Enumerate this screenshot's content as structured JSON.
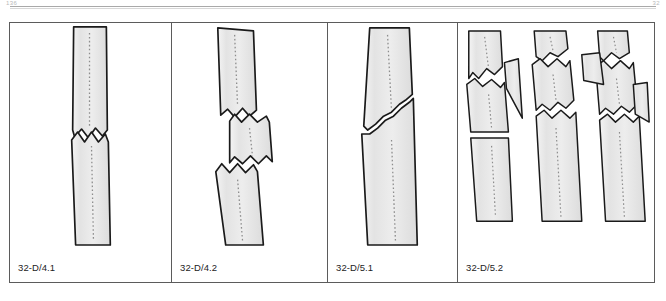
{
  "header": {
    "left_text": "136",
    "right_text": "32",
    "rule_color": "#a9a9a9"
  },
  "figure": {
    "name": "fracture-classification-figure",
    "border_color": "#5b5b5b",
    "background": "#ffffff",
    "bone_fill": "#e8e8e8",
    "bone_outline": "#1a1a1a",
    "marrow_color": "#8d8d8d",
    "panels": [
      {
        "id": "panel-1",
        "label": "32-D/4.1",
        "icon": "bone-transverse-fracture-icon",
        "description": "Simple transverse fracture of diaphysis, single zigzag fracture line, no displacement",
        "fragment_count": 2,
        "fracture_type": "transverse"
      },
      {
        "id": "panel-2",
        "label": "32-D/4.2",
        "icon": "bone-segmental-fracture-icon",
        "description": "Segmental fracture with displaced intermediate shaft segment between two transverse lines",
        "fragment_count": 3,
        "fracture_type": "segmental"
      },
      {
        "id": "panel-3",
        "label": "32-D/5.1",
        "icon": "bone-oblique-fracture-icon",
        "description": "Simple oblique fracture line running across the diaphysis",
        "fragment_count": 2,
        "fracture_type": "oblique"
      },
      {
        "id": "panel-4",
        "label": "32-D/5.2",
        "icon": "bone-comminuted-wedge-fracture-icon",
        "description": "Three variants of comminuted wedge fractures with separated butterfly fragments",
        "fragment_count": 3,
        "fracture_type": "comminuted-wedge",
        "sub_illustrations": [
          {
            "id": "variant-a",
            "description": "Single lateral wedge fragment"
          },
          {
            "id": "variant-b",
            "description": "Oblique wedge with two fracture lines"
          },
          {
            "id": "variant-c",
            "description": "Two separated wedge fragments, multifragmentary"
          }
        ]
      }
    ]
  }
}
